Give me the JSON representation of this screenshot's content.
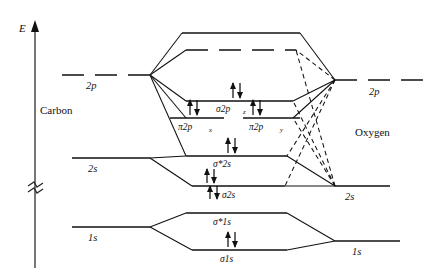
{
  "figure": {
    "kind": "molecular-orbital-energy-diagram",
    "axis": {
      "label": "E",
      "break_symbol": "≈"
    },
    "atoms": {
      "left": {
        "name": "Carbon",
        "levels": [
          {
            "id": "c2p",
            "label": "2p",
            "style": "dashed"
          },
          {
            "id": "c2s",
            "label": "2s",
            "style": "solid"
          },
          {
            "id": "c1s",
            "label": "1s",
            "style": "solid"
          }
        ]
      },
      "right": {
        "name": "Oxygen",
        "levels": [
          {
            "id": "o2p",
            "label": "2p",
            "style": "dashed"
          },
          {
            "id": "o2s",
            "label": "2s",
            "style": "solid"
          },
          {
            "id": "o1s",
            "label": "1s",
            "style": "solid"
          }
        ]
      }
    },
    "molecular_orbitals": [
      {
        "id": "mo-top1",
        "label": "",
        "sub": "",
        "electrons": 0
      },
      {
        "id": "mo-top2",
        "label": "",
        "sub": "",
        "electrons": 0
      },
      {
        "id": "mo-s2pz",
        "label": "σ2p",
        "sub": "z",
        "electrons": 2
      },
      {
        "id": "mo-p2px",
        "label": "π2p",
        "sub": "x",
        "electrons": 2
      },
      {
        "id": "mo-p2py",
        "label": "π2p",
        "sub": "y",
        "electrons": 2
      },
      {
        "id": "mo-s2sa",
        "label": "σ*2s",
        "sub": "",
        "electrons": 2
      },
      {
        "id": "mo-s2s",
        "label": "σ2s",
        "sub": "",
        "electrons": 2
      },
      {
        "id": "mo-s1sa",
        "label": "σ*1s",
        "sub": "",
        "electrons": 0
      },
      {
        "id": "mo-s1s",
        "label": "σ1s",
        "sub": "",
        "electrons": 2
      }
    ],
    "colors": {
      "ink": "#111111",
      "axis": "#4a4a4a",
      "background": "#ffffff"
    }
  }
}
